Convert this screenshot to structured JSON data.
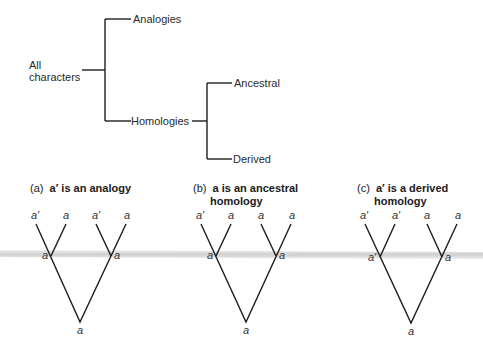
{
  "classification_tree": {
    "root_label_line1": "All",
    "root_label_line2": "characters",
    "branches": [
      {
        "label": "Analogies"
      },
      {
        "label": "Homologies",
        "children": [
          {
            "label": "Ancestral"
          },
          {
            "label": "Derived"
          }
        ]
      }
    ]
  },
  "panels": [
    {
      "prefix": "(a)",
      "title_line1": "a′ is an analogy",
      "title_line2": "",
      "tips": [
        "a′",
        "a",
        "a′",
        "a"
      ],
      "internal_nodes": [
        "a",
        "a"
      ],
      "root": "a"
    },
    {
      "prefix": "(b)",
      "title_line1": "a is an ancestral",
      "title_line2": "homology",
      "tips": [
        "a′",
        "a",
        "a",
        "a"
      ],
      "internal_nodes": [
        "a",
        "a"
      ],
      "root": "a"
    },
    {
      "prefix": "(c)",
      "title_line1": "a′ is a derived",
      "title_line2": "homology",
      "tips": [
        "a′",
        "a′",
        "a",
        "a"
      ],
      "internal_nodes": [
        "a′",
        "a"
      ],
      "root": "a"
    }
  ],
  "colors": {
    "line": "#1e1e1e",
    "text": "#2a2a2a",
    "band": "#d6d6d6"
  }
}
